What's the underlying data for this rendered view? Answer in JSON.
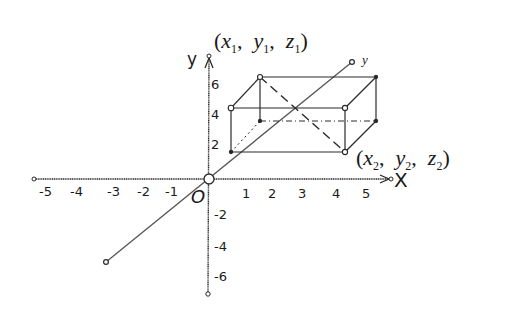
{
  "diagram": {
    "axes": {
      "x": {
        "label": "X",
        "ticks": [
          "-5",
          "-4",
          "-3",
          "-2",
          "-1",
          "1",
          "2",
          "3",
          "4",
          "5"
        ]
      },
      "y": {
        "label": "y",
        "ticks_positive": [
          "2",
          "4",
          "6"
        ],
        "ticks_negative": [
          "-2",
          "-4",
          "-6"
        ]
      },
      "depth": {
        "label": "y"
      },
      "origin_label": "O"
    },
    "points": {
      "p1": {
        "x": "x",
        "x_sub": "1",
        "y": "y",
        "y_sub": "1",
        "z": "z",
        "z_sub": "1"
      },
      "p2": {
        "x": "x",
        "x_sub": "2",
        "y": "y",
        "y_sub": "2",
        "z": "z",
        "z_sub": "2"
      }
    },
    "colors": {
      "stroke": "#2a2a2a",
      "diagonal_axis": "#7a7a7a",
      "background": "#ffffff"
    }
  }
}
